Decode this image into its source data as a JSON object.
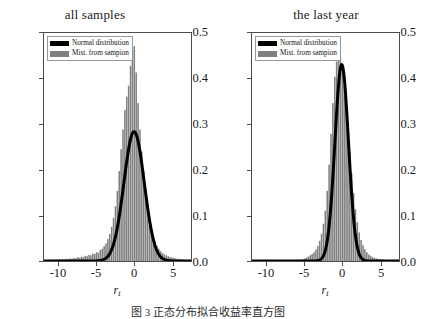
{
  "figure": {
    "caption": "图 3 正态分布拟合收益率直方图",
    "background": "#ffffff",
    "line_color": "#000000",
    "hist_color": "#808080",
    "frame_color": "#4d4d4d"
  },
  "panels": [
    {
      "id": "all-samples",
      "title": "all samples",
      "xlabel_main": "r",
      "xlabel_sub": "t",
      "legend": [
        {
          "key": "normal",
          "label": "Normal distribution",
          "color": "#000000"
        },
        {
          "key": "hist",
          "label": "Mist. from sampion",
          "color": "#808080"
        }
      ],
      "yticks": [
        "0.5",
        "0.4",
        "0.3",
        "0.2",
        "0.1",
        "0.0"
      ],
      "xticks": [
        "-10",
        "-5",
        "0",
        "5"
      ]
    },
    {
      "id": "last-year",
      "title": "the last year",
      "xlabel_main": "r",
      "xlabel_sub": "t",
      "legend": [
        {
          "key": "normal",
          "label": "Normal distribution",
          "color": "#000000"
        },
        {
          "key": "hist",
          "label": "Mist. from sampion",
          "color": "#808080"
        }
      ],
      "yticks": [
        "0.5",
        "0.4",
        "0.3",
        "0.2",
        "0.1",
        "0.0"
      ],
      "xticks": [
        "-10",
        "-5",
        "0",
        "5"
      ]
    }
  ],
  "chart_data": [
    {
      "type": "bar",
      "id": "all-samples",
      "title": "all samples",
      "xlabel": "r_t",
      "ylabel": "",
      "xlim": [
        -12.0,
        7.5
      ],
      "ylim": [
        0.0,
        0.52
      ],
      "xticks": [
        -10,
        -5,
        0,
        5
      ],
      "yticks": [
        0.0,
        0.1,
        0.2,
        0.3,
        0.4,
        0.5
      ],
      "grid": false,
      "legend_position": "upper-left",
      "series": [
        {
          "name": "Mist. from sampion",
          "kind": "histogram",
          "color": "#808080",
          "bin_width": 0.25,
          "bin_centers": [
            -11.5,
            -11.25,
            -11.0,
            -10.75,
            -10.5,
            -10.25,
            -10.0,
            -9.75,
            -9.5,
            -9.25,
            -9.0,
            -8.75,
            -8.5,
            -8.25,
            -8.0,
            -7.75,
            -7.5,
            -7.25,
            -7.0,
            -6.75,
            -6.5,
            -6.25,
            -6.0,
            -5.75,
            -5.5,
            -5.25,
            -5.0,
            -4.75,
            -4.5,
            -4.25,
            -4.0,
            -3.75,
            -3.5,
            -3.25,
            -3.0,
            -2.75,
            -2.5,
            -2.25,
            -2.0,
            -1.75,
            -1.5,
            -1.25,
            -1.0,
            -0.75,
            -0.5,
            -0.25,
            0.0,
            0.25,
            0.5,
            0.75,
            1.0,
            1.25,
            1.5,
            1.75,
            2.0,
            2.25,
            2.5,
            2.75,
            3.0,
            3.25,
            3.5,
            3.75,
            4.0,
            4.25,
            4.5,
            4.75,
            5.0,
            5.25,
            5.5,
            5.75,
            6.0,
            6.25,
            6.5,
            6.75,
            7.0
          ],
          "values": [
            0.002,
            0.0,
            0.002,
            0.0,
            0.003,
            0.002,
            0.004,
            0.002,
            0.004,
            0.003,
            0.005,
            0.004,
            0.006,
            0.005,
            0.007,
            0.006,
            0.009,
            0.007,
            0.01,
            0.009,
            0.012,
            0.011,
            0.014,
            0.013,
            0.017,
            0.016,
            0.02,
            0.019,
            0.025,
            0.028,
            0.034,
            0.04,
            0.05,
            0.062,
            0.078,
            0.098,
            0.125,
            0.16,
            0.205,
            0.255,
            0.3,
            0.345,
            0.375,
            0.4,
            0.445,
            0.48,
            0.49,
            0.43,
            0.36,
            0.3,
            0.25,
            0.205,
            0.165,
            0.13,
            0.098,
            0.075,
            0.058,
            0.045,
            0.035,
            0.028,
            0.022,
            0.018,
            0.015,
            0.013,
            0.011,
            0.009,
            0.008,
            0.007,
            0.006,
            0.005,
            0.004,
            0.004,
            0.003,
            0.002,
            0.002
          ]
        },
        {
          "name": "Normal distribution",
          "kind": "line",
          "color": "#000000",
          "mu": -0.05,
          "sigma": 1.35,
          "peak": 0.295,
          "linewidth": 3.0
        }
      ]
    },
    {
      "type": "bar",
      "id": "last-year",
      "title": "the last year",
      "xlabel": "r_t",
      "ylabel": "",
      "xlim": [
        -12.0,
        7.5
      ],
      "ylim": [
        0.0,
        0.52
      ],
      "xticks": [
        -10,
        -5,
        0,
        5
      ],
      "yticks": [
        0.0,
        0.1,
        0.2,
        0.3,
        0.4,
        0.5
      ],
      "grid": false,
      "legend_position": "upper-left",
      "series": [
        {
          "name": "Mist. from sampion",
          "kind": "histogram",
          "color": "#808080",
          "bin_width": 0.25,
          "bin_centers": [
            -11.5,
            -11.25,
            -11.0,
            -10.75,
            -10.5,
            -10.25,
            -10.0,
            -9.75,
            -9.5,
            -9.25,
            -9.0,
            -8.75,
            -8.5,
            -8.25,
            -8.0,
            -7.75,
            -7.5,
            -7.25,
            -7.0,
            -6.75,
            -6.5,
            -6.25,
            -6.0,
            -5.75,
            -5.5,
            -5.25,
            -5.0,
            -4.75,
            -4.5,
            -4.25,
            -4.0,
            -3.75,
            -3.5,
            -3.25,
            -3.0,
            -2.75,
            -2.5,
            -2.25,
            -2.0,
            -1.75,
            -1.5,
            -1.25,
            -1.0,
            -0.75,
            -0.5,
            -0.25,
            0.0,
            0.25,
            0.5,
            0.75,
            1.0,
            1.25,
            1.5,
            1.75,
            2.0,
            2.25,
            2.5,
            2.75,
            3.0,
            3.25,
            3.5,
            3.75,
            4.0,
            4.25,
            4.5,
            4.75,
            5.0,
            5.25,
            5.5,
            5.75,
            6.0,
            6.25,
            6.5
          ],
          "values": [
            0.0,
            0.0,
            0.0,
            0.0,
            0.0,
            0.0,
            0.0,
            0.0,
            0.0,
            0.0,
            0.0,
            0.0,
            0.0,
            0.0,
            0.0,
            0.0,
            0.0,
            0.0,
            0.0,
            0.0,
            0.0,
            0.0,
            0.0,
            0.002,
            0.003,
            0.004,
            0.006,
            0.008,
            0.01,
            0.013,
            0.016,
            0.02,
            0.026,
            0.034,
            0.046,
            0.062,
            0.085,
            0.115,
            0.16,
            0.22,
            0.29,
            0.36,
            0.42,
            0.455,
            0.47,
            0.465,
            0.44,
            0.4,
            0.35,
            0.3,
            0.25,
            0.2,
            0.155,
            0.118,
            0.088,
            0.065,
            0.048,
            0.036,
            0.027,
            0.02,
            0.015,
            0.012,
            0.009,
            0.007,
            0.006,
            0.005,
            0.004,
            0.003,
            0.003,
            0.002,
            0.002,
            0.001,
            0.001
          ]
        },
        {
          "name": "Normal distribution",
          "kind": "line",
          "color": "#000000",
          "mu": -0.1,
          "sigma": 0.9,
          "peak": 0.448,
          "linewidth": 3.0
        }
      ]
    }
  ]
}
